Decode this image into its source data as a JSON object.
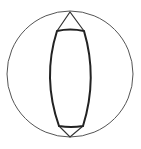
{
  "diagram": {
    "type": "geometric-figure",
    "colors": {
      "background": "#ffffff",
      "stroke": "#333333"
    },
    "outer_circle": {
      "cx": 70,
      "cy": 74,
      "r": 63,
      "stroke_width": 1
    },
    "top_vertex": {
      "x": 70,
      "y": 12
    },
    "bottom_vertex": {
      "x": 70,
      "y": 137
    },
    "top_chord": {
      "x1": 57,
      "x2": 84,
      "y": 31
    },
    "bottom_chord": {
      "x1": 59,
      "x2": 83,
      "y": 126
    },
    "lens_stroke_width": 2
  }
}
